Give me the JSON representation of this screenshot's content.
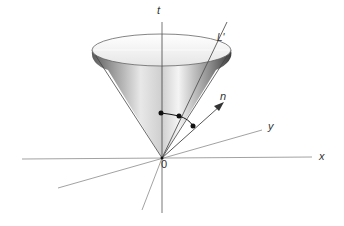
{
  "diagram": {
    "type": "light-cone",
    "labels": {
      "t_axis": "t",
      "x_axis": "x",
      "y_axis": "y",
      "origin": "0",
      "line": "L'",
      "normal": "n"
    },
    "colors": {
      "axis": "#8a8a8a",
      "cone_dark": "#3a3a3a",
      "cone_light": "#f2f2f2",
      "points": "#111111"
    }
  }
}
